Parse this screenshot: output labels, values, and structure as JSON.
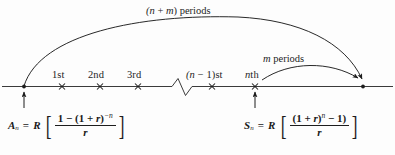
{
  "figure": {
    "background_color": "#fdfdfd",
    "ink_color": "#1d1d1d"
  },
  "timeline": {
    "axis_label": "time-line",
    "endpoint_left": "●",
    "endpoint_right": "●",
    "break_symbol": "zigzag",
    "ticks": [
      {
        "label": "1st",
        "x": 62
      },
      {
        "label": "2nd",
        "x": 100
      },
      {
        "label": "3rd",
        "x": 138
      },
      {
        "label": "(n − 1)st",
        "x": 212
      },
      {
        "label": "nth",
        "x": 255
      }
    ]
  },
  "arcs": [
    {
      "name": "total-periods-arc",
      "label": "(n + m) periods"
    },
    {
      "name": "m-periods-arc",
      "label": "m periods"
    }
  ],
  "labels": {
    "tick_1": "1st",
    "tick_2": "2nd",
    "tick_3": "3rd",
    "tick_n_minus_1": "(n − 1)st",
    "tick_n": "nth",
    "arc_total": "(n + m) periods",
    "arc_total_paren_open": "(",
    "arc_total_n": "n",
    "arc_total_plus": "+",
    "arc_total_m": "m",
    "arc_total_rest": ") periods",
    "arc_m_var": "m",
    "arc_m_rest": "periods"
  },
  "formula_left": {
    "name": "present-value-formula",
    "symbol": "A",
    "subscript": "n",
    "equals": "=",
    "coefficient": "R",
    "numerator_plain": "1 − (1 + r)⁻ⁿ",
    "numerator_parts": {
      "one": "1",
      "minus": "−",
      "paren_open": "(",
      "one2": "1",
      "plus": "+",
      "r": "r",
      "paren_close": ")",
      "exponent": "−n"
    },
    "denominator": "r",
    "full_text": "Aₙ = R [ (1 − (1 + r)⁻ⁿ) / r ]"
  },
  "formula_right": {
    "name": "future-value-formula",
    "symbol": "S",
    "subscript": "n",
    "equals": "=",
    "coefficient": "R",
    "numerator_plain": "(1 + r)ⁿ − 1)",
    "numerator_parts": {
      "paren_open": "(",
      "one": "1",
      "plus": "+",
      "r": "r",
      "paren_close": ")",
      "exponent": "n",
      "minus": "−",
      "one2": "1",
      "paren_close2": ")"
    },
    "denominator": "r",
    "full_text": "Sₙ = R [ ((1 + r)ⁿ − 1) / r ]"
  },
  "pointers": [
    {
      "name": "pointer-to-A",
      "target_tick": "start"
    },
    {
      "name": "pointer-to-S",
      "target_tick": "nth"
    }
  ]
}
